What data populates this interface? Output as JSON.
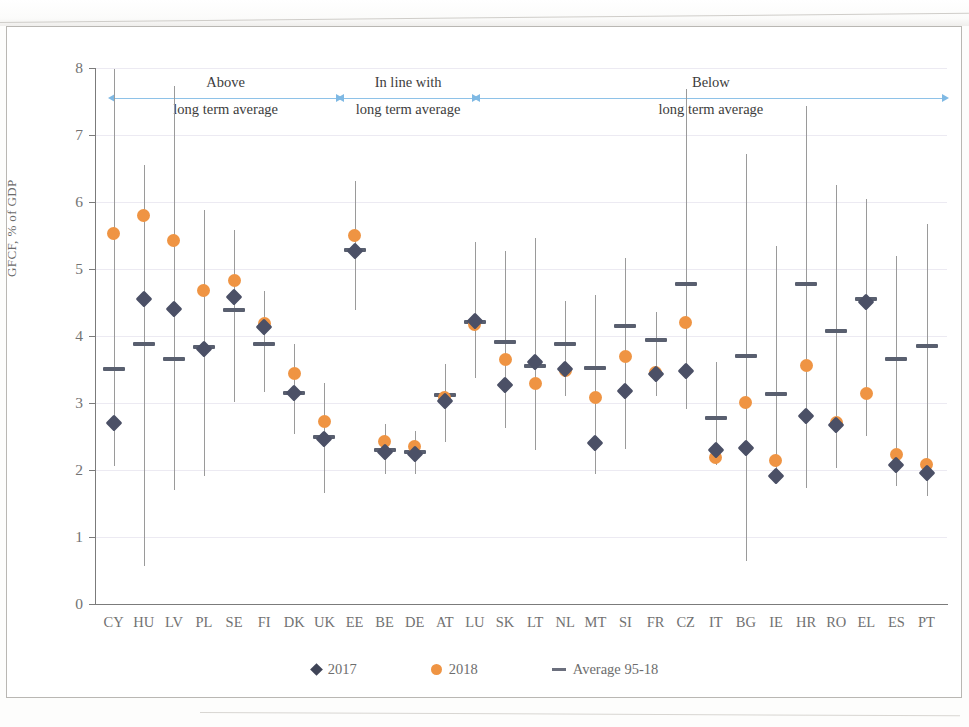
{
  "chart_data": {
    "type": "scatter",
    "title": "",
    "xlabel": "",
    "ylabel": "GFCF, % of GDP",
    "ylim": [
      0,
      8
    ],
    "ytick_labels": [
      "0",
      "1",
      "2",
      "3",
      "4",
      "5",
      "6",
      "7",
      "8"
    ],
    "grid": true,
    "legend_position": "bottom",
    "legend": [
      {
        "name": "2017",
        "marker": "diamond",
        "color": "#4b5066"
      },
      {
        "name": "2018",
        "marker": "circle",
        "color": "#ef9443"
      },
      {
        "name": "Average 95-18",
        "marker": "dash",
        "color": "#6b6f7d"
      }
    ],
    "categories": [
      "CY",
      "HU",
      "LV",
      "PL",
      "SE",
      "FI",
      "DK",
      "UK",
      "EE",
      "BE",
      "DE",
      "AT",
      "LU",
      "SK",
      "LT",
      "NL",
      "MT",
      "SI",
      "FR",
      "CZ",
      "IT",
      "BG",
      "IE",
      "HR",
      "RO",
      "EL",
      "ES",
      "PT"
    ],
    "series": [
      {
        "name": "2017",
        "values": [
          2.72,
          4.57,
          4.42,
          3.82,
          4.6,
          4.15,
          3.17,
          2.48,
          5.28,
          2.29,
          2.26,
          3.04,
          4.24,
          3.28,
          3.62,
          3.52,
          2.42,
          3.19,
          3.45,
          3.49,
          2.32,
          2.35,
          1.93,
          2.82,
          2.68,
          4.52,
          2.09,
          1.97
        ]
      },
      {
        "name": "2018",
        "values": [
          5.54,
          5.82,
          5.44,
          4.7,
          4.84,
          4.2,
          3.46,
          2.74,
          5.52,
          2.44,
          2.37,
          3.1,
          4.18,
          3.66,
          3.3,
          3.5,
          3.09,
          3.71,
          3.47,
          4.22,
          2.2,
          3.02,
          2.16,
          3.58,
          2.73,
          3.16,
          2.24,
          2.09
        ]
      },
      {
        "name": "Average 95-18",
        "values": [
          3.52,
          3.89,
          3.67,
          3.85,
          4.4,
          3.9,
          3.17,
          2.51,
          5.3,
          2.31,
          2.28,
          3.14,
          4.22,
          3.93,
          3.57,
          3.89,
          3.54,
          4.17,
          3.95,
          4.79,
          2.79,
          3.72,
          3.15,
          4.79,
          4.09,
          4.56,
          3.67,
          3.86
        ]
      }
    ],
    "ranges": [
      {
        "category": "CY",
        "min": 2.07,
        "max": 8.0
      },
      {
        "category": "HU",
        "min": 0.58,
        "max": 6.56
      },
      {
        "category": "LV",
        "min": 1.72,
        "max": 7.75
      },
      {
        "category": "PL",
        "min": 1.92,
        "max": 5.89
      },
      {
        "category": "SE",
        "min": 3.03,
        "max": 5.6
      },
      {
        "category": "FI",
        "min": 3.18,
        "max": 4.68
      },
      {
        "category": "DK",
        "min": 2.55,
        "max": 3.9
      },
      {
        "category": "UK",
        "min": 1.67,
        "max": 3.32
      },
      {
        "category": "EE",
        "min": 4.4,
        "max": 6.33
      },
      {
        "category": "BE",
        "min": 1.95,
        "max": 2.7
      },
      {
        "category": "DE",
        "min": 1.95,
        "max": 2.6
      },
      {
        "category": "AT",
        "min": 2.43,
        "max": 3.6
      },
      {
        "category": "LU",
        "min": 3.39,
        "max": 5.42
      },
      {
        "category": "SK",
        "min": 2.64,
        "max": 5.28
      },
      {
        "category": "LT",
        "min": 2.32,
        "max": 5.48
      },
      {
        "category": "NL",
        "min": 3.12,
        "max": 4.54
      },
      {
        "category": "MT",
        "min": 1.95,
        "max": 4.62
      },
      {
        "category": "SI",
        "min": 2.33,
        "max": 5.18
      },
      {
        "category": "FR",
        "min": 3.12,
        "max": 4.38
      },
      {
        "category": "CZ",
        "min": 2.92,
        "max": 7.7
      },
      {
        "category": "IT",
        "min": 2.09,
        "max": 3.62
      },
      {
        "category": "BG",
        "min": 0.65,
        "max": 6.73
      },
      {
        "category": "IE",
        "min": 1.97,
        "max": 5.36
      },
      {
        "category": "HR",
        "min": 1.75,
        "max": 7.45
      },
      {
        "category": "RO",
        "min": 2.05,
        "max": 6.27
      },
      {
        "category": "EL",
        "min": 2.52,
        "max": 6.06
      },
      {
        "category": "ES",
        "min": 1.78,
        "max": 5.21
      },
      {
        "category": "PT",
        "min": 1.63,
        "max": 5.69
      }
    ],
    "annotations": [
      {
        "id": "above",
        "line1": "Above",
        "line2": "long term average"
      },
      {
        "id": "inline",
        "line1": "In line with",
        "line2": "long term average"
      },
      {
        "id": "below",
        "line1": "Below",
        "line2": "long term average"
      }
    ]
  }
}
